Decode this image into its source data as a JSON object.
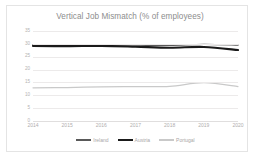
{
  "chart_data": {
    "type": "line",
    "title": "Vertical Job Mismatch (% of employees)",
    "xlabel": "",
    "ylabel": "",
    "categories": [
      "2014",
      "2015",
      "2016",
      "2017",
      "2018",
      "2019",
      "2020"
    ],
    "x": [
      2014,
      2015,
      2016,
      2017,
      2018,
      2019,
      2020
    ],
    "ylim": [
      0,
      35
    ],
    "yticks": [
      0,
      5,
      10,
      15,
      20,
      25,
      30,
      35
    ],
    "ytick_labels": [
      "0",
      "5",
      "10",
      "15",
      "20",
      "25",
      "30",
      "35"
    ],
    "grid": true,
    "legend_position": "bottom",
    "series": [
      {
        "name": "Ireland",
        "color": "#595959",
        "width": 1.3,
        "values": [
          29.6,
          29.5,
          29.6,
          29.5,
          29.4,
          29.8,
          29.5
        ]
      },
      {
        "name": "Austria",
        "color": "#1a1a1a",
        "width": 2.1,
        "values": [
          29.2,
          29.1,
          29.2,
          28.9,
          28.5,
          28.8,
          27.6
        ]
      },
      {
        "name": "Portugal",
        "color": "#c9c9c9",
        "width": 1.2,
        "values": [
          12.9,
          13.0,
          13.3,
          13.4,
          13.5,
          14.9,
          13.4
        ]
      }
    ]
  },
  "title": "Vertical Job Mismatch (% of employees)",
  "legend": {
    "items": [
      {
        "label": "Ireland"
      },
      {
        "label": "Austria"
      },
      {
        "label": "Portugal"
      }
    ]
  }
}
